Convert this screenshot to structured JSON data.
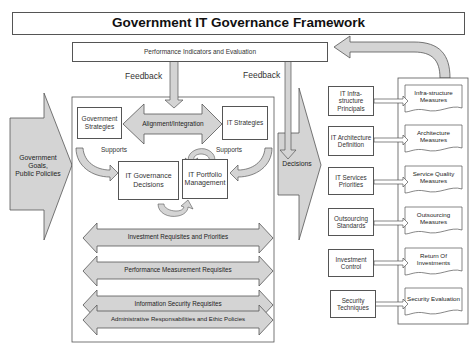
{
  "title": "Government IT Governance Framework",
  "performance_box": "Performance Indicators and Evaluation",
  "feedback_left": "Feedback",
  "feedback_right": "Feedback",
  "left_input": {
    "line1": "Government",
    "line2": "Goals,",
    "line3": "Public Policiies"
  },
  "core": {
    "gov_strategies": "Government Strategies",
    "alignment": "Alignment/Integration",
    "it_strategies": "IT Strategies",
    "supports_left": "Supports",
    "supports_right": "Supports",
    "it_gov_decisions": "IT Governance Decisions",
    "it_portfolio": "IT Portfolio Management"
  },
  "requisites": [
    "Investment Requisites and Priorities",
    "Performance Measurement Requisites",
    "Information Security Requisites",
    "Administrative Responsabilities and Ethic Policies"
  ],
  "decisions": "Decisions",
  "domains": [
    "IT Infra-structure Principals",
    "IT Architecture Definition",
    "IT Services Priorities",
    "Outsourcing Standards",
    "Investment Control",
    "Security Techniques"
  ],
  "measures": [
    "Infra-structure Measures",
    "Architecture Measures",
    "Service Quality Measures",
    "Outsourcing Measures",
    "Return Of Investments",
    "Security Evaluation"
  ],
  "colors": {
    "arrow_fill": "#d4d4d4",
    "line": "#555555"
  }
}
